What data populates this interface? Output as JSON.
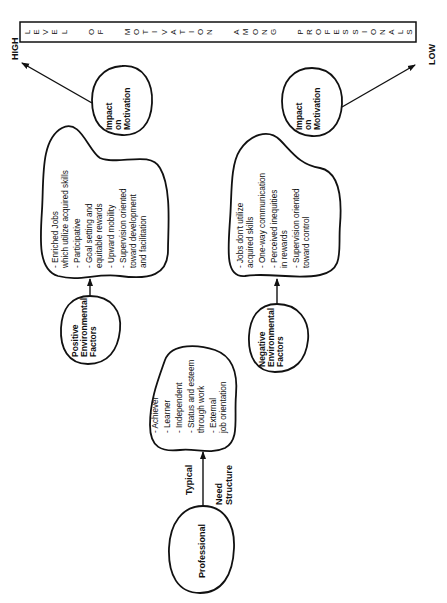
{
  "title": {
    "letters": "LEVEL  OF  MOTIVATION  AMONG  PROFESSIONALS",
    "text": "LEVEL OF MOTIVATION AMONG PROFESSIONALS"
  },
  "scale": {
    "high": "HIGH",
    "low": "LOW"
  },
  "nodes": {
    "professional": {
      "label": "Professional"
    },
    "need_structure": {
      "label_typical": "Typical",
      "label_need": "Need",
      "label_structure": "Structure",
      "items": [
        [
          "- Achiever"
        ],
        [
          "- Learner"
        ],
        [
          "- Independent"
        ],
        [
          "- Status and esteem",
          "   through work"
        ],
        [
          "- External",
          "   job orientation"
        ]
      ]
    },
    "positive_factors": {
      "lines": [
        "Positive",
        "Environmental",
        "Factors"
      ]
    },
    "negative_factors": {
      "lines": [
        "Negative",
        "Environmental",
        "Factors"
      ]
    },
    "positive_conditions": {
      "items": [
        [
          "- Enriched Jobs",
          "   which utilize acquired skills"
        ],
        [
          "- Participative"
        ],
        [
          "- Goal setting and",
          "   equitable rewards"
        ],
        [
          "- Upward mobility"
        ],
        [
          "- Supervision oriented",
          "   toward development",
          "   and facilitation"
        ]
      ]
    },
    "negative_conditions": {
      "items": [
        [
          "- Jobs don't utilize",
          "   acquired skills"
        ],
        [
          "- One-way communication"
        ],
        [
          "- Perceived inequities",
          "   in rewards"
        ],
        [
          "- Supervision oriented",
          "   toward control"
        ]
      ]
    },
    "impact_high": {
      "lines": [
        "Impact",
        "on",
        "Motivation"
      ]
    },
    "impact_low": {
      "lines": [
        "Impact",
        "on",
        "Motivation"
      ]
    }
  },
  "colors": {
    "ink": "#111111",
    "background": "#ffffff"
  }
}
